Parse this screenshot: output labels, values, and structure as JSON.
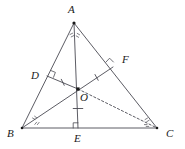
{
  "figure": {
    "type": "geometry-diagram",
    "width": 185,
    "height": 149,
    "stroke_color": "#4a4a52",
    "point_color": "#1a1a1a",
    "background": "#ffffff",
    "points": {
      "A": {
        "x": 74,
        "y": 23,
        "label": "A",
        "label_x": 68,
        "label_y": 4
      },
      "B": {
        "x": 22,
        "y": 128,
        "label": "B",
        "label_x": 7,
        "label_y": 128
      },
      "C": {
        "x": 157,
        "y": 128,
        "label": "C",
        "label_x": 166,
        "label_y": 128
      },
      "D": {
        "x": 47,
        "y": 76,
        "label": "D",
        "label_x": 31,
        "label_y": 70
      },
      "E": {
        "x": 78,
        "y": 128,
        "label": "E",
        "label_x": 74,
        "label_y": 143
      },
      "F": {
        "x": 113,
        "y": 67,
        "label": "F",
        "label_x": 122,
        "label_y": 59
      },
      "O": {
        "x": 78,
        "y": 89,
        "label": "O",
        "label_x": 80,
        "label_y": 99
      }
    },
    "solid_segments": [
      {
        "name": "side-AB",
        "from": "A",
        "to": "B"
      },
      {
        "name": "side-AC",
        "from": "A",
        "to": "C"
      },
      {
        "name": "side-BC",
        "from": "B",
        "to": "C"
      },
      {
        "name": "bisector-A-E",
        "from": "A",
        "to": "E"
      },
      {
        "name": "bisector-B-F",
        "from": "B",
        "to": "F"
      },
      {
        "name": "perpendicular-O-D",
        "from": "O",
        "to": "D"
      }
    ],
    "dashed_segments": [
      {
        "name": "bisector-O-C",
        "from": "O",
        "to": "C"
      }
    ],
    "right_angle_marks": [
      {
        "name": "right-angle-at-D",
        "vertex": "D"
      },
      {
        "name": "right-angle-at-E",
        "vertex": "E"
      },
      {
        "name": "right-angle-at-F",
        "vertex": "F"
      }
    ],
    "equal_length_ticks": [
      {
        "name": "tick-OD",
        "segment": "OD"
      },
      {
        "name": "tick-OE",
        "segment": "OE"
      },
      {
        "name": "tick-OF",
        "segment": "OF"
      }
    ],
    "angle_bisector_marks": [
      {
        "name": "angle-marks-A",
        "vertex": "A",
        "count": 2
      },
      {
        "name": "angle-marks-B",
        "vertex": "B",
        "count": 2
      },
      {
        "name": "angle-marks-C",
        "vertex": "C",
        "count": 2
      }
    ]
  }
}
